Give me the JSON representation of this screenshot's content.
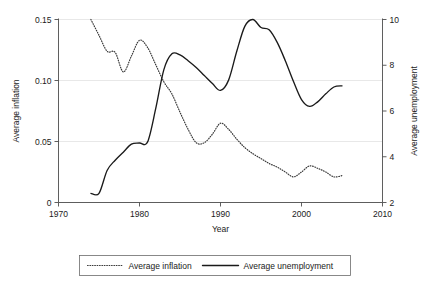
{
  "chart_data": {
    "type": "line",
    "title": "",
    "xlabel": "Year",
    "ylabel": "Average inflation",
    "y2label": "Average unemployment",
    "xlim": [
      1970,
      2010
    ],
    "ylim": [
      0,
      0.15
    ],
    "y2lim": [
      2,
      10
    ],
    "xticks": [
      "1970",
      "1980",
      "1990",
      "2000",
      "2010"
    ],
    "xtick_values": [
      1970,
      1980,
      1990,
      2000,
      2010
    ],
    "yticks": [
      "0",
      "0.05",
      "0.10",
      "0.15"
    ],
    "ytick_values": [
      0,
      0.05,
      0.1,
      0.15
    ],
    "y2ticks": [
      "2",
      "4",
      "6",
      "8",
      "10"
    ],
    "y2tick_values": [
      2,
      4,
      6,
      8,
      10
    ],
    "grid": true,
    "grid_axis": "y",
    "legend_position": "bottom-outside",
    "series": [
      {
        "name": "Average inflation",
        "axis": "left",
        "style": "dotted",
        "x": [
          1974,
          1975,
          1976,
          1977,
          1978,
          1979,
          1980,
          1981,
          1982,
          1983,
          1984,
          1985,
          1986,
          1987,
          1988,
          1989,
          1990,
          1991,
          1992,
          1993,
          1994,
          1995,
          1996,
          1997,
          1998,
          1999,
          2000,
          2001,
          2002,
          2003,
          2004,
          2005
        ],
        "values": [
          0.15,
          0.137,
          0.124,
          0.123,
          0.107,
          0.12,
          0.133,
          0.127,
          0.113,
          0.099,
          0.089,
          0.074,
          0.06,
          0.049,
          0.049,
          0.056,
          0.065,
          0.06,
          0.052,
          0.045,
          0.04,
          0.036,
          0.032,
          0.029,
          0.025,
          0.021,
          0.025,
          0.03,
          0.028,
          0.025,
          0.021,
          0.022
        ]
      },
      {
        "name": "Average unemployment",
        "axis": "right",
        "style": "solid",
        "x": [
          1974,
          1975,
          1976,
          1977,
          1978,
          1979,
          1980,
          1981,
          1982,
          1983,
          1984,
          1985,
          1986,
          1987,
          1988,
          1989,
          1990,
          1991,
          1992,
          1993,
          1994,
          1995,
          1996,
          1997,
          1998,
          1999,
          2000,
          2001,
          2002,
          2003,
          2004,
          2005
        ],
        "values": [
          2.4,
          2.4,
          3.4,
          3.85,
          4.2,
          4.55,
          4.6,
          4.65,
          6.1,
          7.8,
          8.5,
          8.45,
          8.2,
          7.9,
          7.55,
          7.2,
          6.9,
          7.35,
          8.6,
          9.7,
          10.0,
          9.65,
          9.55,
          9.0,
          8.2,
          7.3,
          6.5,
          6.2,
          6.4,
          6.75,
          7.05,
          7.1
        ]
      }
    ],
    "legend_entries": [
      {
        "label": "Average inflation",
        "style": "dotted"
      },
      {
        "label": "Average unemployment",
        "style": "solid"
      }
    ]
  }
}
